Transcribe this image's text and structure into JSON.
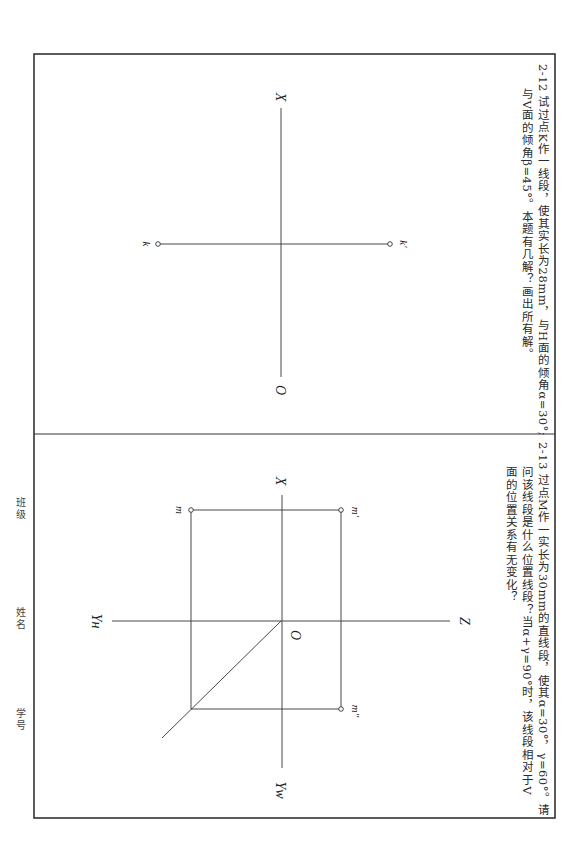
{
  "page": {
    "orientation": "rotated-90-clockwise",
    "frame_color": "#333333"
  },
  "problems": [
    {
      "number": "2-12",
      "line1": "试过点K作一线段，使其实长为28mm，与H面的倾角α=30°;",
      "line2": "与V面的倾角β=45°。本题有几解？画出所有解。",
      "axis_labels": {
        "x": "X",
        "o": "O"
      },
      "points": {
        "k": "k",
        "k_prime": "k′"
      }
    },
    {
      "number": "2-13",
      "line1": "过点M作一实长为30mm的直线段，使其α=30°，γ=60°。请",
      "line2": "问该线段是什么位置线段？当α+γ=90°时，该线段相对于V",
      "line3": "面的位置关系有无变化？",
      "axis_labels": {
        "x": "X",
        "z": "Z",
        "o": "O",
        "yh": "Yн",
        "yw": "Yw"
      },
      "points": {
        "m": "m",
        "m_prime": "m′",
        "m_double_prime": "m″"
      }
    }
  ],
  "footer_fields": {
    "class": "班级",
    "name": "姓名",
    "student_id": "学号"
  }
}
